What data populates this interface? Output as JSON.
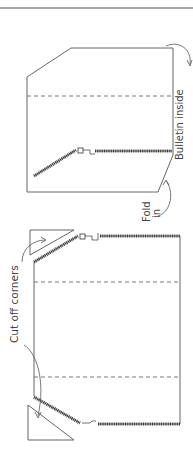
{
  "diagram": {
    "top_rule": true,
    "labels": {
      "bulletin_inside": "Bulletin inside",
      "fold": "Fold",
      "fold_in": "in",
      "cut_off_corners": "Cut off corners"
    },
    "panels": [
      {
        "name": "folded-pouch",
        "description": "Pouch with corner folded in and bulletin inside"
      },
      {
        "name": "flat-pouch",
        "description": "Flat pouch with two zippers and corners cut off"
      }
    ],
    "colors": {
      "line": "#555555",
      "zipper": "#444444",
      "background": "#ffffff"
    }
  }
}
